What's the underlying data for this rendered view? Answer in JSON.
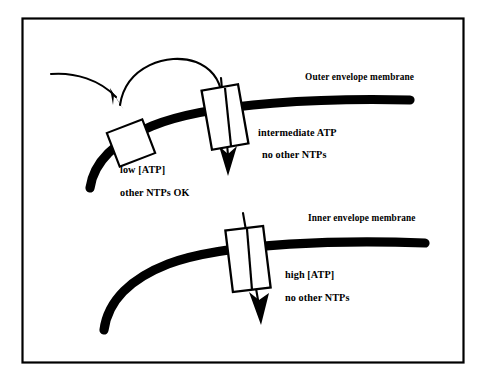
{
  "figure": {
    "border_color": "#000000",
    "ink_color": "#000000",
    "background_color": "#ffffff",
    "upper_membrane_label": "Outer envelope membrane",
    "lower_membrane_label": "Inner envelope membrane",
    "closed_channel": {
      "condition_line1": "low [ATP]",
      "condition_line2": "other NTPs OK"
    },
    "outer_open_channel": {
      "condition_line1": "intermediate ATP",
      "condition_line2": "no other NTPs"
    },
    "inner_open_channel": {
      "condition_line1": "high [ATP]",
      "condition_line2": "no other NTPs"
    }
  }
}
